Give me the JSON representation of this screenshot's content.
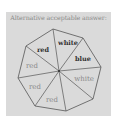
{
  "panel": {
    "title": "Alternative acceptable answer:",
    "background": "#dadada",
    "page_background": "#ffffff"
  },
  "octagon": {
    "center": [
      59,
      71
    ],
    "vertices": [
      [
        53,
        29
      ],
      [
        83,
        38
      ],
      [
        101,
        67
      ],
      [
        93,
        99
      ],
      [
        66,
        111
      ],
      [
        35,
        106
      ],
      [
        18,
        78
      ],
      [
        26,
        46
      ]
    ],
    "stroke": "#555555"
  },
  "sectors": [
    {
      "label": "red",
      "bold": true,
      "x": 43,
      "y": 52,
      "color": "#333333"
    },
    {
      "label": "white",
      "bold": true,
      "x": 68,
      "y": 45,
      "color": "#333333"
    },
    {
      "label": "blue",
      "bold": true,
      "x": 83,
      "y": 61,
      "color": "#333333"
    },
    {
      "label": "white",
      "bold": false,
      "x": 83,
      "y": 80,
      "color": "#8a8a8a"
    },
    {
      "label": "",
      "bold": false,
      "x": 80,
      "y": 96,
      "color": "#8a8a8a"
    },
    {
      "label": "red",
      "bold": false,
      "x": 52,
      "y": 102,
      "color": "#8a8a8a"
    },
    {
      "label": "red",
      "bold": false,
      "x": 34,
      "y": 88,
      "color": "#8a8a8a"
    },
    {
      "label": "red",
      "bold": false,
      "x": 31,
      "y": 67,
      "color": "#8a8a8a"
    }
  ]
}
